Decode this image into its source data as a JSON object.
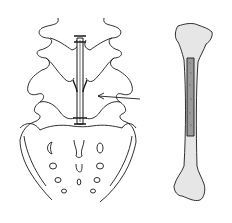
{
  "figure": {
    "panels": [
      {
        "id": "spine",
        "description": "Lumbar spine and sacrum with strut graft placed between spinous processes",
        "annotation": "arrow pointing to graft"
      },
      {
        "id": "bone",
        "description": "Long bone (tibia) with rectangular graft harvest site on shaft"
      }
    ]
  },
  "colors": {
    "line": "#1a1a1a",
    "bone_fill": "#e6e6e6",
    "graft_fill": "#9a9a9a",
    "background": "#ffffff"
  }
}
